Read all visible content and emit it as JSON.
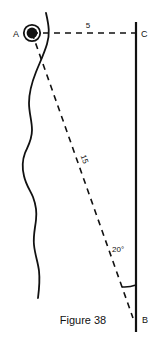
{
  "figure": {
    "caption": "Figure 38",
    "background_color": "#ffffff",
    "stroke_color": "#111111",
    "points": [
      {
        "id": "A",
        "label": "A",
        "x": 32,
        "y": 33,
        "label_x": 16,
        "label_y": 37,
        "marker": "ringed-dot"
      },
      {
        "id": "C",
        "label": "C",
        "x": 136,
        "y": 33,
        "label_x": 141,
        "label_y": 37,
        "marker": "none"
      },
      {
        "id": "B",
        "label": "B",
        "x": 133,
        "y": 318,
        "label_x": 142,
        "label_y": 323,
        "marker": "none"
      }
    ],
    "segments": [
      {
        "id": "AC",
        "from": "A",
        "to": "C",
        "style": "dashed",
        "length_label": "5",
        "label_x": 88,
        "label_y": 28
      },
      {
        "id": "AB",
        "from": "A",
        "to": "B",
        "style": "dashed",
        "length_label": "15",
        "label_x": 82,
        "label_y": 160,
        "label_rotation": 71
      },
      {
        "id": "CB",
        "from": "C",
        "to": "B",
        "style": "solid",
        "length_label": "",
        "description": "vertical-line"
      }
    ],
    "angle": {
      "id": "B",
      "label": "20°",
      "vertex": "B",
      "label_x": 112,
      "label_y": 252,
      "arc_radius": 32
    },
    "curve": {
      "id": "shoreline",
      "style": "solid-freehand",
      "description": "irregular vertical curve"
    }
  }
}
